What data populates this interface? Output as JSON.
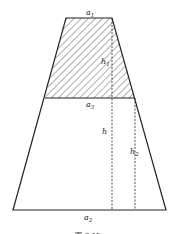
{
  "diagram": {
    "type": "trapezoid-section",
    "labels": {
      "a1": {
        "base": "a",
        "sub": "1"
      },
      "a2": {
        "base": "a",
        "sub": "2"
      },
      "a3": {
        "base": "a",
        "sub": "3"
      },
      "h": {
        "base": "h",
        "sub": ""
      },
      "h1": {
        "base": "h",
        "sub": "1"
      },
      "h2": {
        "base": "h",
        "sub": "2"
      }
    },
    "caption": "图 8-15",
    "colors": {
      "stroke": "#222222",
      "hatch": "#333333",
      "background": "#ffffff"
    }
  }
}
